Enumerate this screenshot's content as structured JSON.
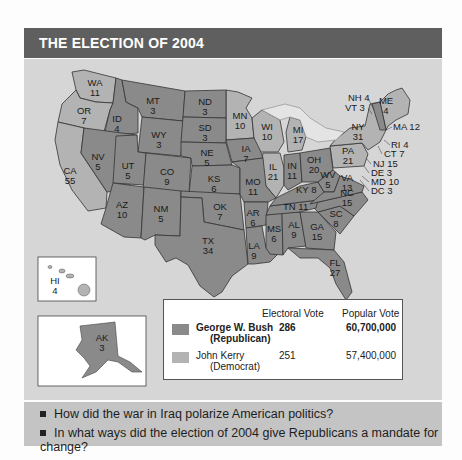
{
  "title": "THE ELECTION OF 2004",
  "colors": {
    "republican": "#8a8a8a",
    "democrat": "#b3b3b3",
    "header_bg": "#5f5f5f",
    "panel_bg": "#d6d6d6",
    "questions_bg": "#c4c4c4"
  },
  "states": {
    "WA": {
      "abbr": "WA",
      "votes": "11",
      "party": "democrat"
    },
    "OR": {
      "abbr": "OR",
      "votes": "7",
      "party": "democrat"
    },
    "CA": {
      "abbr": "CA",
      "votes": "55",
      "party": "democrat"
    },
    "ID": {
      "abbr": "ID",
      "votes": "4",
      "party": "republican"
    },
    "NV": {
      "abbr": "NV",
      "votes": "5",
      "party": "republican"
    },
    "MT": {
      "abbr": "MT",
      "votes": "3",
      "party": "republican"
    },
    "WY": {
      "abbr": "WY",
      "votes": "3",
      "party": "republican"
    },
    "UT": {
      "abbr": "UT",
      "votes": "5",
      "party": "republican"
    },
    "AZ": {
      "abbr": "AZ",
      "votes": "10",
      "party": "republican"
    },
    "CO": {
      "abbr": "CO",
      "votes": "9",
      "party": "republican"
    },
    "NM": {
      "abbr": "NM",
      "votes": "5",
      "party": "republican"
    },
    "ND": {
      "abbr": "ND",
      "votes": "3",
      "party": "republican"
    },
    "SD": {
      "abbr": "SD",
      "votes": "3",
      "party": "republican"
    },
    "NE": {
      "abbr": "NE",
      "votes": "5",
      "party": "republican"
    },
    "KS": {
      "abbr": "KS",
      "votes": "6",
      "party": "republican"
    },
    "OK": {
      "abbr": "OK",
      "votes": "7",
      "party": "republican"
    },
    "TX": {
      "abbr": "TX",
      "votes": "34",
      "party": "republican"
    },
    "MN": {
      "abbr": "MN",
      "votes": "10",
      "party": "democrat"
    },
    "IA": {
      "abbr": "IA",
      "votes": "7",
      "party": "republican"
    },
    "MO": {
      "abbr": "MO",
      "votes": "11",
      "party": "republican"
    },
    "AR": {
      "abbr": "AR",
      "votes": "6",
      "party": "republican"
    },
    "LA": {
      "abbr": "LA",
      "votes": "9",
      "party": "republican"
    },
    "WI": {
      "abbr": "WI",
      "votes": "10",
      "party": "democrat"
    },
    "IL": {
      "abbr": "IL",
      "votes": "21",
      "party": "democrat"
    },
    "MI": {
      "abbr": "MI",
      "votes": "17",
      "party": "democrat"
    },
    "IN": {
      "abbr": "IN",
      "votes": "11",
      "party": "republican"
    },
    "OH": {
      "abbr": "OH",
      "votes": "20",
      "party": "republican"
    },
    "KY": {
      "abbr": "KY",
      "votes": "8",
      "party": "republican"
    },
    "TN": {
      "abbr": "TN",
      "votes": "11",
      "party": "republican"
    },
    "MS": {
      "abbr": "MS",
      "votes": "6",
      "party": "republican"
    },
    "AL": {
      "abbr": "AL",
      "votes": "9",
      "party": "republican"
    },
    "GA": {
      "abbr": "GA",
      "votes": "15",
      "party": "republican"
    },
    "FL": {
      "abbr": "FL",
      "votes": "27",
      "party": "republican"
    },
    "SC": {
      "abbr": "SC",
      "votes": "8",
      "party": "republican"
    },
    "NC": {
      "abbr": "NC",
      "votes": "15",
      "party": "republican"
    },
    "VA": {
      "abbr": "VA",
      "votes": "13",
      "party": "republican"
    },
    "WV": {
      "abbr": "WV",
      "votes": "5",
      "party": "republican"
    },
    "PA": {
      "abbr": "PA",
      "votes": "21",
      "party": "democrat"
    },
    "NY": {
      "abbr": "NY",
      "votes": "31",
      "party": "democrat"
    },
    "ME": {
      "abbr": "ME",
      "votes": "4",
      "party": "democrat"
    },
    "HI": {
      "abbr": "HI",
      "votes": "4",
      "party": "democrat"
    },
    "AK": {
      "abbr": "AK",
      "votes": "3",
      "party": "republican"
    }
  },
  "callouts": {
    "NH": "NH 4",
    "VT": "VT 3",
    "MA": "MA 12",
    "RI": "RI 4",
    "CT": "CT 7",
    "NJ": "NJ 15",
    "DE": "DE 3",
    "MD": "MD 10",
    "DC": "DC 3",
    "KY": "KY 8",
    "TN": "TN 11"
  },
  "legend": {
    "electoral_header": "Electoral Vote",
    "popular_header": "Popular Vote",
    "candidates": [
      {
        "name": "George W. Bush",
        "party": "(Republican)",
        "electoral": "286",
        "popular": "60,700,000"
      },
      {
        "name": "John Kerry",
        "party": "(Democrat)",
        "electoral": "251",
        "popular": "57,400,000"
      }
    ]
  },
  "questions": [
    "How did the war in Iraq polarize American politics?",
    "In what ways did the election of 2004 give Republicans a mandate for change?"
  ]
}
